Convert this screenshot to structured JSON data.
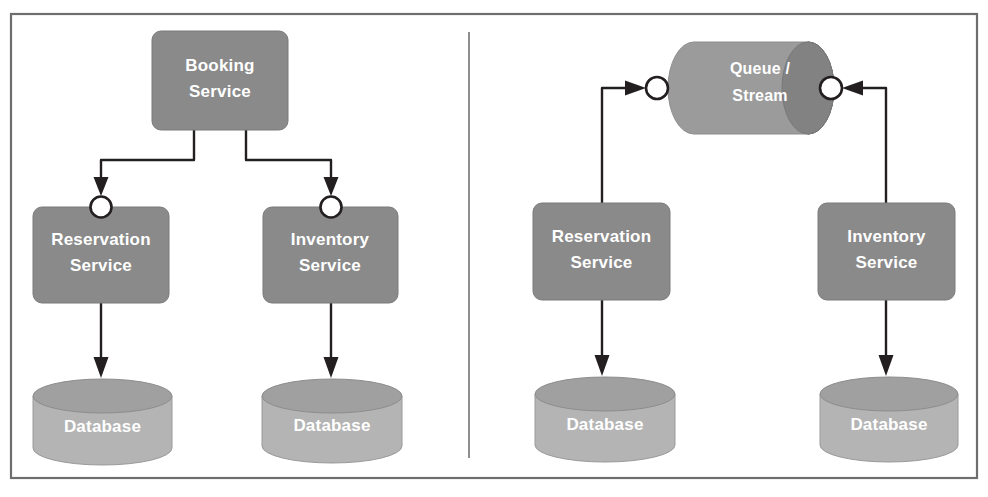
{
  "figure": {
    "panels": [
      {
        "id": "left",
        "name": "synchronous-orchestration",
        "nodes": {
          "orchestrator": {
            "label_line1": "Booking",
            "label_line2": "Service"
          },
          "service_a": {
            "label_line1": "Reservation",
            "label_line2": "Service"
          },
          "service_b": {
            "label_line1": "Inventory",
            "label_line2": "Service"
          },
          "db_a": {
            "label": "Database"
          },
          "db_b": {
            "label": "Database"
          }
        }
      },
      {
        "id": "right",
        "name": "asynchronous-messaging",
        "nodes": {
          "broker": {
            "label_line1": "Queue /",
            "label_line2": "Stream"
          },
          "service_a": {
            "label_line1": "Reservation",
            "label_line2": "Service"
          },
          "service_b": {
            "label_line1": "Inventory",
            "label_line2": "Service"
          },
          "db_a": {
            "label": "Database"
          },
          "db_b": {
            "label": "Database"
          }
        }
      }
    ]
  },
  "colors": {
    "service_box": "#8a8a8a",
    "database_body": "#b4b4b4",
    "database_top": "#a0a0a0",
    "queue_body": "#9b9b9b",
    "queue_cap": "#828282",
    "line": "#231f20",
    "port_fill": "#ffffff",
    "frame": "#6e6e6e",
    "divider": "#8e8e8e",
    "label_text": "#ffffff",
    "background": "#ffffff"
  },
  "icons": {
    "port": "interface-port-circle-icon",
    "arrow": "arrowhead-icon",
    "cylinder": "database-cylinder-icon",
    "queue": "queue-cylinder-icon"
  }
}
